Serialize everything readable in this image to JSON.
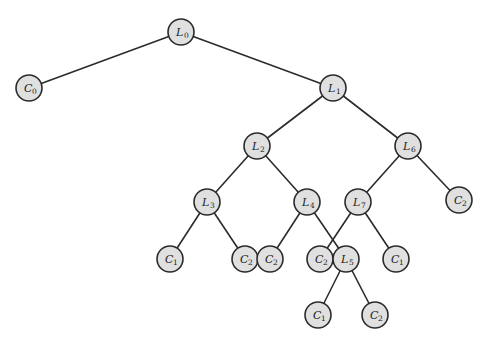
{
  "diagram": {
    "type": "tree",
    "node_radius": 13,
    "colors": {
      "node_fill": "#e0e0e0",
      "stroke": "#2b2b2b",
      "background": "#ffffff"
    },
    "nodes": [
      {
        "id": "L0",
        "letter": "L",
        "sub": "0",
        "x": 181,
        "y": 32
      },
      {
        "id": "C0",
        "letter": "C",
        "sub": "0",
        "x": 29,
        "y": 88
      },
      {
        "id": "L1",
        "letter": "L",
        "sub": "1",
        "x": 333,
        "y": 88
      },
      {
        "id": "L2",
        "letter": "L",
        "sub": "2",
        "x": 257,
        "y": 146
      },
      {
        "id": "L6",
        "letter": "L",
        "sub": "6",
        "x": 408,
        "y": 146
      },
      {
        "id": "L3",
        "letter": "L",
        "sub": "3",
        "x": 207,
        "y": 202
      },
      {
        "id": "L4",
        "letter": "L",
        "sub": "4",
        "x": 307,
        "y": 202
      },
      {
        "id": "L7",
        "letter": "L",
        "sub": "7",
        "x": 358,
        "y": 202
      },
      {
        "id": "C2a",
        "letter": "C",
        "sub": "2",
        "x": 459,
        "y": 200
      },
      {
        "id": "C1a",
        "letter": "C",
        "sub": "1",
        "x": 170,
        "y": 259
      },
      {
        "id": "C2b",
        "letter": "C",
        "sub": "2",
        "x": 245,
        "y": 259
      },
      {
        "id": "C2c",
        "letter": "C",
        "sub": "2",
        "x": 270,
        "y": 259
      },
      {
        "id": "C2d",
        "letter": "C",
        "sub": "2",
        "x": 320,
        "y": 259
      },
      {
        "id": "L5",
        "letter": "L",
        "sub": "5",
        "x": 346,
        "y": 259
      },
      {
        "id": "C1b",
        "letter": "C",
        "sub": "1",
        "x": 396,
        "y": 259
      },
      {
        "id": "C1c",
        "letter": "C",
        "sub": "1",
        "x": 318,
        "y": 315
      },
      {
        "id": "C2e",
        "letter": "C",
        "sub": "2",
        "x": 375,
        "y": 315
      }
    ],
    "edges": [
      [
        "L0",
        "C0"
      ],
      [
        "L0",
        "L1"
      ],
      [
        "L1",
        "L2"
      ],
      [
        "L1",
        "L6"
      ],
      [
        "L2",
        "L3"
      ],
      [
        "L2",
        "L4"
      ],
      [
        "L6",
        "L7"
      ],
      [
        "L6",
        "C2a"
      ],
      [
        "L3",
        "C1a"
      ],
      [
        "L3",
        "C2b"
      ],
      [
        "L4",
        "C2c"
      ],
      [
        "L4",
        "L5"
      ],
      [
        "L7",
        "C2d"
      ],
      [
        "L7",
        "C1b"
      ],
      [
        "L5",
        "C1c"
      ],
      [
        "L5",
        "C2e"
      ]
    ]
  }
}
